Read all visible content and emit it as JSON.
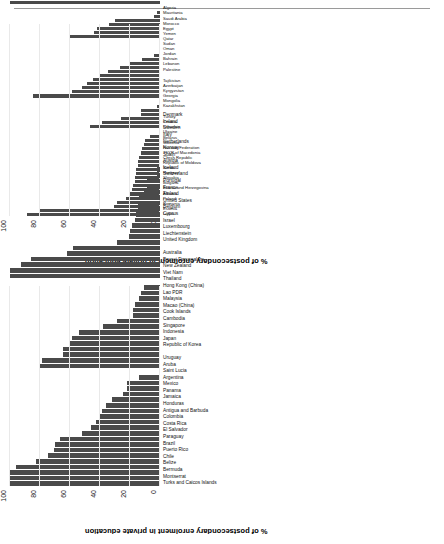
{
  "page": {
    "corner_mark": "",
    "axis_title": "% of postsecondary enrolment in private education",
    "y_ticks": [
      "0",
      "20",
      "40",
      "60",
      "80",
      "100"
    ]
  },
  "chart_data": [
    {
      "type": "bar",
      "id": "top-chart",
      "title": "",
      "xlabel": "",
      "ylabel": "% of postsecondary enrolment in private education",
      "ylim": [
        0,
        100
      ],
      "grid": true,
      "orientation": "vertical-bars-rotated-page",
      "bar_color": "#4a4a4a",
      "groups": [
        {
          "name": "Central and Eastern Europe",
          "categories": [
            "Latvia",
            "Estonia",
            "Romania",
            "Poland",
            "Albania",
            "Bosnia and Herzegovina",
            "Bulgaria",
            "Slovakia",
            "Hungary",
            "Serbia",
            "Republic of Moldova",
            "Czech Republic",
            "TFYR of Macedonia",
            "Russian Federation",
            "Slovenia",
            "Belarus",
            "Ukraine",
            "Lithuania",
            "Croatia",
            "Turkey"
          ],
          "values": [
            89,
            81,
            31,
            29,
            23,
            20,
            19,
            18,
            17,
            17,
            16,
            16,
            15,
            15,
            14,
            13,
            12,
            11,
            10,
            7
          ]
        },
        {
          "name": "Central Asia",
          "categories": [
            "Kazakhstan",
            "Mongolia",
            "Georgia",
            "Kyrgyzstan",
            "Azerbaijan",
            "Tajikistan"
          ],
          "values": [
            47,
            39,
            26,
            13,
            13,
            2
          ]
        },
        {
          "name": "Arab States",
          "categories": [
            "Palestine",
            "Lebanon",
            "Bahrain",
            "Jordan",
            "Oman",
            "Sudan",
            "Qatar",
            "Yemen",
            "Egypt",
            "Morocco",
            "Saudi Arabia",
            "Mauritania",
            "Algeria"
          ],
          "values": [
            85,
            59,
            52,
            49,
            45,
            41,
            35,
            27,
            21,
            12,
            4,
            1,
            1
          ]
        },
        {
          "name": "South and West Asia",
          "categories": [
            "Nepal",
            "India",
            "Bangladesh",
            "Bhutan",
            "Iran",
            "Sri Lanka",
            "Afghanistan"
          ],
          "values": [
            61,
            44,
            42,
            34,
            30,
            4,
            2
          ]
        },
        {
          "name": "Sub-Saharan Africa",
          "categories": [
            "Seychelles",
            "Côte d'Ivoire",
            "Cabo Verde",
            "Rwanda",
            "Uganda",
            "Mauritius",
            "Angola",
            "Guinea",
            "Congo",
            "Burundi",
            "Sao Tome and Principe",
            "Malawi",
            "Chad",
            "Gabon",
            "Niger",
            "Central African Republic",
            "Madagascar",
            "Benin",
            "Burkina Faso",
            "Ghana",
            "Tanzania",
            "Cameroon",
            "Lesotho",
            "Togo",
            "Zimbabwe",
            "Mali"
          ],
          "values": [
            100,
            81,
            62,
            57,
            54,
            50,
            47,
            45,
            44,
            42,
            39,
            33,
            32,
            30,
            28,
            26,
            24,
            23,
            22,
            20,
            18,
            16,
            15,
            14,
            13,
            12
          ]
        }
      ]
    },
    {
      "type": "bar",
      "id": "bottom-chart",
      "title": "",
      "xlabel": "",
      "ylabel": "% of postsecondary enrolment in private education",
      "ylim": [
        0,
        100
      ],
      "grid": true,
      "orientation": "vertical-bars-rotated-page",
      "bar_color": "#4a4a4a",
      "groups": [
        {
          "name": "Latin America and the Caribbean",
          "categories": [
            "Turks and Caicos Islands",
            "Montserrat",
            "Bermuda",
            "Belize",
            "Chile",
            "Puerto Rico",
            "Brazil",
            "Paraguay",
            "El Salvador",
            "Costa Rica",
            "Colombia",
            "Antigua and Barbuda",
            "Honduras",
            "Jamaica",
            "Panama",
            "Mexico",
            "Argentina",
            "Saint Lucia",
            "Aruba",
            "Uruguay"
          ],
          "values": [
            100,
            100,
            100,
            96,
            83,
            75,
            71,
            70,
            67,
            52,
            46,
            43,
            40,
            39,
            36,
            32,
            25,
            22,
            22,
            14
          ]
        },
        {
          "name": "East Asia and the Pacific",
          "categories": [
            "Republic of Korea",
            "Japan",
            "Indonesia",
            "Singapore",
            "Cambodia",
            "Cook Islands",
            "Macao (China)",
            "Malaysia",
            "Lao PDR",
            "Hong Kong (China)",
            "Thailand",
            "Viet Nam",
            "New Zealand",
            "Brunei Darussalam",
            "Australia"
          ],
          "values": [
            80,
            79,
            65,
            65,
            60,
            59,
            54,
            38,
            29,
            18,
            18,
            17,
            14,
            13,
            11
          ]
        },
        {
          "name": "North America and Western Europe",
          "categories": [
            "United Kingdom",
            "Liechtenstein",
            "Luxembourg",
            "Israel",
            "Cyprus",
            "Belgium",
            "United States",
            "Finland",
            "France",
            "Portugal",
            "Switzerland",
            "Iceland",
            "Austria",
            "Spain",
            "Norway",
            "Netherlands",
            "Italy",
            "Sweden",
            "Ireland",
            "Denmark"
          ],
          "values": [
            100,
            100,
            93,
            86,
            62,
            58,
            29,
            21,
            20,
            19,
            17,
            16,
            15,
            15,
            14,
            11,
            9,
            9,
            2,
            2
          ]
        }
      ]
    }
  ]
}
